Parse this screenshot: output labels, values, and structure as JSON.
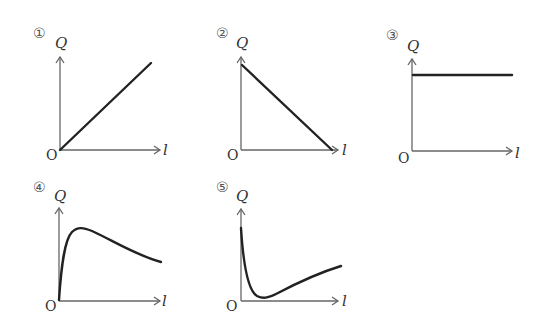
{
  "graphs": [
    {
      "id": "1",
      "label": "①",
      "y_axis": "Q",
      "x_axis": "l",
      "origin": "O",
      "shape": "linear increasing from origin"
    },
    {
      "id": "2",
      "label": "②",
      "y_axis": "Q",
      "x_axis": "l",
      "origin": "O",
      "shape": "linear decreasing to zero"
    },
    {
      "id": "3",
      "label": "③",
      "y_axis": "Q",
      "x_axis": "l",
      "origin": "O",
      "shape": "constant"
    },
    {
      "id": "4",
      "label": "④",
      "y_axis": "Q",
      "x_axis": "l",
      "origin": "O",
      "shape": "rises steeply to peak then decays"
    },
    {
      "id": "5",
      "label": "⑤",
      "y_axis": "Q",
      "x_axis": "l",
      "origin": "O",
      "shape": "falls steeply to minimum then rises"
    }
  ],
  "colors": {
    "curve": "#222222",
    "axis": "#666666",
    "text": "#333333"
  }
}
